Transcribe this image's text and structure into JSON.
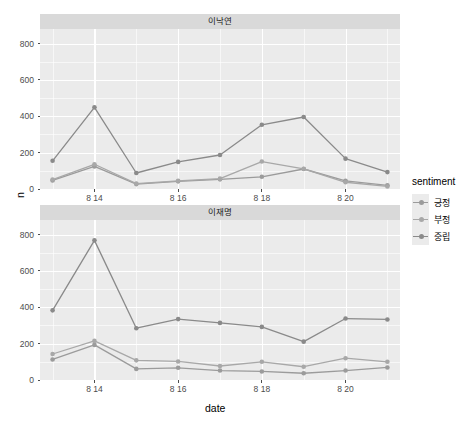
{
  "chart_data": {
    "type": "line",
    "title": "",
    "xlabel": "date",
    "ylabel": "n",
    "ylim": [
      0,
      880
    ],
    "yticks": [
      0,
      200,
      400,
      600,
      800
    ],
    "ytick_labels": [
      "0",
      "200",
      "400",
      "600",
      "800"
    ],
    "x": [
      "8 13",
      "8 14",
      "8 15",
      "8 16",
      "8 17",
      "8 18",
      "8 19",
      "8 20",
      "8 21"
    ],
    "xticks": [
      "8 14",
      "8 16",
      "8 18",
      "8 20"
    ],
    "xtick_index": [
      1,
      3,
      5,
      7
    ],
    "grid": true,
    "legend": {
      "title": "sentiment",
      "position": "right",
      "entries": [
        "긍정",
        "부정",
        "중립"
      ]
    },
    "facets": [
      {
        "name": "이낙연",
        "series": [
          {
            "name": "긍정",
            "color": "#9b9b9b",
            "values": [
              47,
              124,
              27,
              42,
              53,
              67,
              110,
              45,
              20
            ]
          },
          {
            "name": "부정",
            "color": "#a8a8a8",
            "values": [
              52,
              136,
              30,
              45,
              57,
              151,
              111,
              37,
              14
            ]
          },
          {
            "name": "중립",
            "color": "#8a8a8a",
            "values": [
              155,
              449,
              88,
              149,
              187,
              353,
              396,
              167,
              93
            ]
          }
        ]
      },
      {
        "name": "이재명",
        "series": [
          {
            "name": "긍정",
            "color": "#9b9b9b",
            "values": [
              113,
              193,
              61,
              67,
              52,
              47,
              37,
              52,
              69
            ]
          },
          {
            "name": "부정",
            "color": "#a8a8a8",
            "values": [
              143,
              215,
              108,
              102,
              77,
              100,
              73,
              120,
              100
            ]
          },
          {
            "name": "중립",
            "color": "#8a8a8a",
            "values": [
              383,
              768,
              285,
              335,
              314,
              292,
              211,
              338,
              333
            ]
          }
        ]
      }
    ]
  },
  "axis": {
    "x_title": "date",
    "y_title": "n"
  }
}
